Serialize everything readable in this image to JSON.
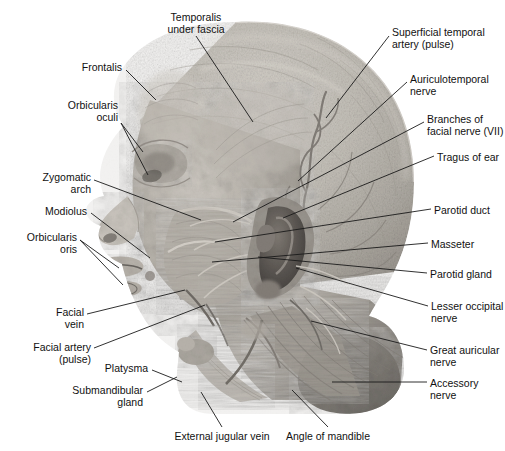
{
  "figure": {
    "background_color": "#ffffff",
    "text_color": "#111111",
    "leader_color": "#1a1a1a",
    "width": 505,
    "height": 451
  },
  "labels": [
    {
      "id": "temporalis-under-fascia",
      "text": "Temporalis\nunder fascia",
      "align": "center",
      "x": 196,
      "y": 11,
      "leader": [
        {
          "x1": 196,
          "y1": 36,
          "x2": 253,
          "y2": 122
        }
      ]
    },
    {
      "id": "frontalis",
      "text": "Frontalis",
      "align": "right",
      "x": 122,
      "y": 61,
      "leader": [
        {
          "x1": 126,
          "y1": 70,
          "x2": 156,
          "y2": 100
        }
      ]
    },
    {
      "id": "orbicularis-oculi",
      "text": "Orbicularis\noculi",
      "align": "right",
      "x": 118,
      "y": 99,
      "leader": [
        {
          "x1": 121,
          "y1": 123,
          "x2": 143,
          "y2": 152
        },
        {
          "x1": 121,
          "y1": 123,
          "x2": 148,
          "y2": 175
        }
      ]
    },
    {
      "id": "zygomatic-arch",
      "text": "Zygomatic\narch",
      "align": "right",
      "x": 91,
      "y": 171,
      "leader": [
        {
          "x1": 94,
          "y1": 180,
          "x2": 201,
          "y2": 220
        }
      ]
    },
    {
      "id": "modiolus",
      "text": "Modiolus",
      "align": "right",
      "x": 87,
      "y": 205,
      "leader": [
        {
          "x1": 91,
          "y1": 213,
          "x2": 150,
          "y2": 258
        }
      ]
    },
    {
      "id": "orbicularis-oris",
      "text": "Orbicularis\noris",
      "align": "right",
      "x": 77,
      "y": 231,
      "leader": [
        {
          "x1": 80,
          "y1": 240,
          "x2": 119,
          "y2": 268
        },
        {
          "x1": 80,
          "y1": 240,
          "x2": 123,
          "y2": 285
        }
      ]
    },
    {
      "id": "facial-vein",
      "text": "Facial\nvein",
      "align": "right",
      "x": 84,
      "y": 306,
      "leader": [
        {
          "x1": 87,
          "y1": 314,
          "x2": 185,
          "y2": 290
        }
      ]
    },
    {
      "id": "facial-artery-pulse",
      "text": "Facial artery\n(pulse)",
      "align": "right",
      "x": 91,
      "y": 341,
      "leader": [
        {
          "x1": 94,
          "y1": 348,
          "x2": 205,
          "y2": 305
        }
      ]
    },
    {
      "id": "platysma",
      "text": "Platysma",
      "align": "right",
      "x": 148,
      "y": 362,
      "leader": [
        {
          "x1": 152,
          "y1": 370,
          "x2": 182,
          "y2": 382
        }
      ]
    },
    {
      "id": "submandibular-gland",
      "text": "Submandibular\ngland",
      "align": "right",
      "x": 143,
      "y": 384,
      "leader": [
        {
          "x1": 147,
          "y1": 392,
          "x2": 177,
          "y2": 377
        }
      ]
    },
    {
      "id": "external-jugular-vein",
      "text": "External jugular vein",
      "align": "center",
      "x": 222,
      "y": 430,
      "leader": [
        {
          "x1": 222,
          "y1": 427,
          "x2": 201,
          "y2": 392
        }
      ]
    },
    {
      "id": "angle-of-mandible",
      "text": "Angle of mandible",
      "align": "center",
      "x": 328,
      "y": 430,
      "leader": [
        {
          "x1": 328,
          "y1": 427,
          "x2": 292,
          "y2": 390
        }
      ]
    },
    {
      "id": "superficial-temporal-artery-pulse",
      "text": "Superficial temporal\nartery (pulse)",
      "align": "left",
      "x": 392,
      "y": 26,
      "leader": [
        {
          "x1": 389,
          "y1": 36,
          "x2": 326,
          "y2": 118
        }
      ]
    },
    {
      "id": "auriculotemporal-nerve",
      "text": "Auriculotemporal\nnerve",
      "align": "left",
      "x": 410,
      "y": 73,
      "leader": [
        {
          "x1": 407,
          "y1": 82,
          "x2": 298,
          "y2": 181
        }
      ]
    },
    {
      "id": "branches-of-facial-nerve",
      "text": "Branches of\nfacial nerve (VII)",
      "align": "left",
      "x": 427,
      "y": 113,
      "leader": [
        {
          "x1": 424,
          "y1": 122,
          "x2": 233,
          "y2": 222
        }
      ]
    },
    {
      "id": "tragus-of-ear",
      "text": "Tragus of ear",
      "align": "left",
      "x": 437,
      "y": 151,
      "leader": [
        {
          "x1": 434,
          "y1": 156,
          "x2": 283,
          "y2": 218
        }
      ]
    },
    {
      "id": "parotid-duct",
      "text": "Parotid duct",
      "align": "left",
      "x": 434,
      "y": 204,
      "leader": [
        {
          "x1": 431,
          "y1": 209,
          "x2": 215,
          "y2": 242
        }
      ]
    },
    {
      "id": "masseter",
      "text": "Masseter",
      "align": "left",
      "x": 431,
      "y": 238,
      "leader": [
        {
          "x1": 428,
          "y1": 243,
          "x2": 212,
          "y2": 262
        }
      ]
    },
    {
      "id": "parotid-gland",
      "text": "Parotid gland",
      "align": "left",
      "x": 430,
      "y": 268,
      "leader": [
        {
          "x1": 427,
          "y1": 273,
          "x2": 258,
          "y2": 257
        }
      ]
    },
    {
      "id": "lesser-occipital-nerve",
      "text": "Lesser occipital\nnerve",
      "align": "left",
      "x": 431,
      "y": 300,
      "leader": [
        {
          "x1": 428,
          "y1": 306,
          "x2": 296,
          "y2": 268
        }
      ]
    },
    {
      "id": "great-auricular-nerve",
      "text": "Great auricular\nnerve",
      "align": "left",
      "x": 430,
      "y": 344,
      "leader": [
        {
          "x1": 427,
          "y1": 350,
          "x2": 311,
          "y2": 321
        }
      ]
    },
    {
      "id": "accessory-nerve",
      "text": "Accessory\nnerve",
      "align": "left",
      "x": 430,
      "y": 377,
      "leader": [
        {
          "x1": 427,
          "y1": 382,
          "x2": 332,
          "y2": 382
        }
      ]
    }
  ]
}
